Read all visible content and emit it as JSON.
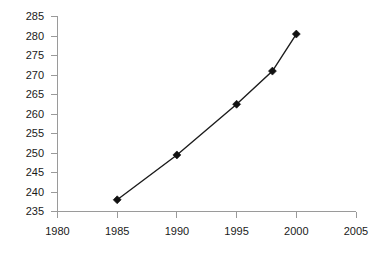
{
  "chart_data": {
    "type": "line",
    "title": "",
    "subtitle": "",
    "xlabel": "",
    "ylabel": "",
    "x": [
      1985,
      1990,
      1995,
      1998,
      2000
    ],
    "values": [
      238,
      249.5,
      262.5,
      271,
      280.5
    ],
    "series": [
      {
        "name": "",
        "x": [
          1985,
          1990,
          1995,
          1998,
          2000
        ],
        "values": [
          238,
          249.5,
          262.5,
          271,
          280.5
        ],
        "marker": "diamond",
        "color": "#111111"
      }
    ],
    "xlim": [
      1980,
      2005
    ],
    "ylim": [
      235,
      285
    ],
    "xticks": [
      1980,
      1985,
      1990,
      1995,
      2000,
      2005
    ],
    "yticks": [
      235,
      240,
      245,
      250,
      255,
      260,
      265,
      270,
      275,
      280,
      285
    ],
    "xtick_labels": [
      "1980",
      "1985",
      "1990",
      "1995",
      "2000",
      "2005"
    ],
    "ytick_labels": [
      "235",
      "240",
      "245",
      "250",
      "255",
      "260",
      "265",
      "270",
      "275",
      "280",
      "285"
    ],
    "grid": false,
    "legend": false,
    "legend_position": "none",
    "annotations": [],
    "colors": {
      "line": "#1c1c1c",
      "marker": "#111111",
      "axis": "#9a9a9a",
      "text": "#1a1a1a",
      "background": "#ffffff"
    }
  }
}
